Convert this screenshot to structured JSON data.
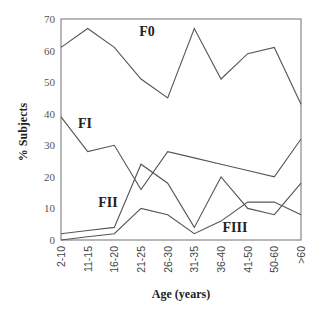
{
  "chart_data": {
    "type": "line",
    "title": "",
    "xlabel": "Age (years)",
    "ylabel": "% Subjects",
    "categories": [
      "2-10",
      "11-15",
      "16-20",
      "21-25",
      "26-30",
      "31-35",
      "36-40",
      "41-50",
      "50-60",
      ">60"
    ],
    "ylim": [
      0,
      70
    ],
    "yticks": [
      0,
      10,
      20,
      30,
      40,
      50,
      60,
      70
    ],
    "grid": false,
    "legend": "inline labels",
    "series": [
      {
        "name": "F0",
        "values": [
          61,
          67,
          61,
          51,
          45,
          67,
          51,
          59,
          61,
          43
        ],
        "label_pos": [
          147,
          31
        ]
      },
      {
        "name": "FI",
        "values": [
          39,
          28,
          30,
          16,
          28,
          26,
          24,
          22,
          20,
          32
        ],
        "label_pos": [
          85,
          123
        ]
      },
      {
        "name": "FII",
        "values": [
          2,
          3,
          4,
          24,
          18,
          4,
          20,
          10,
          8,
          18
        ],
        "label_pos": [
          108,
          202
        ]
      },
      {
        "name": "FIII",
        "values": [
          0,
          1,
          2,
          10,
          8,
          2,
          6,
          12,
          12,
          8
        ],
        "label_pos": [
          235,
          227
        ]
      }
    ],
    "colors": {
      "line": "#555555",
      "frame": "#888888",
      "text": "#222222"
    }
  }
}
